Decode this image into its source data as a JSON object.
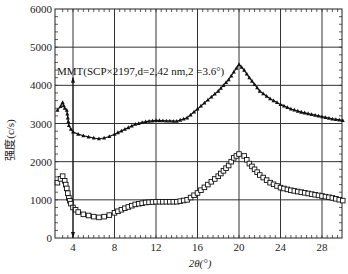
{
  "chart_data": {
    "type": "scatter",
    "title": "",
    "xlabel": "2θ(°)",
    "ylabel": "强度(c/s)",
    "xlim": [
      2.3,
      30
    ],
    "ylim": [
      0,
      6000
    ],
    "grid": true,
    "x_ticks": [
      4,
      8,
      12,
      16,
      20,
      24,
      28
    ],
    "y_ticks": [
      0,
      1000,
      2000,
      3000,
      4000,
      5000,
      6000
    ],
    "annotations": [
      {
        "text": "MMT(SCP×2197,d=2,42 nm,2  =3.6°)",
        "arrow_x": 4,
        "arrow_from_y": 4200,
        "arrow_to_y": 0
      }
    ],
    "series": [
      {
        "name": "upper (triangles)",
        "marker": "triangle",
        "x": [
          2.5,
          2.8,
          3.0,
          3.2,
          3.4,
          3.6,
          3.8,
          4.0,
          4.5,
          5.0,
          5.5,
          6.0,
          6.5,
          7.0,
          7.5,
          8.0,
          9.0,
          10.0,
          11.0,
          12.0,
          13.0,
          14.0,
          15.0,
          16.0,
          17.0,
          18.0,
          19.0,
          19.5,
          20.0,
          20.5,
          21.0,
          22.0,
          23.0,
          24.0,
          25.0,
          26.0,
          27.0,
          28.0,
          29.0,
          30.0
        ],
        "values": [
          3350,
          3450,
          3550,
          3400,
          3350,
          2950,
          2850,
          2780,
          2720,
          2680,
          2650,
          2620,
          2600,
          2620,
          2660,
          2720,
          2850,
          2980,
          3050,
          3080,
          3070,
          3060,
          3150,
          3380,
          3620,
          3850,
          4150,
          4350,
          4550,
          4400,
          4200,
          3850,
          3650,
          3500,
          3380,
          3300,
          3240,
          3180,
          3120,
          3080
        ]
      },
      {
        "name": "lower (squares)",
        "marker": "square",
        "x": [
          2.5,
          2.8,
          3.0,
          3.2,
          3.4,
          3.6,
          3.8,
          4.0,
          4.5,
          5.0,
          5.5,
          6.0,
          6.5,
          7.0,
          7.5,
          8.0,
          9.0,
          10.0,
          11.0,
          12.0,
          13.0,
          14.0,
          15.0,
          16.0,
          17.0,
          18.0,
          19.0,
          19.5,
          20.0,
          20.5,
          21.0,
          22.0,
          23.0,
          24.0,
          25.0,
          26.0,
          27.0,
          28.0,
          29.0,
          30.0
        ],
        "values": [
          1450,
          1550,
          1620,
          1500,
          1300,
          1050,
          900,
          800,
          680,
          620,
          590,
          560,
          540,
          560,
          600,
          660,
          780,
          880,
          930,
          950,
          950,
          950,
          1000,
          1180,
          1400,
          1620,
          1900,
          2100,
          2200,
          2150,
          1950,
          1650,
          1450,
          1320,
          1250,
          1200,
          1150,
          1100,
          1050,
          980
        ]
      }
    ]
  },
  "labels": {
    "ylabel": "强度(c/s)",
    "xlabel": "2θ(°)",
    "annotation": "MMT(SCP×2197,d=2,42 nm,2  =3.6°)"
  }
}
